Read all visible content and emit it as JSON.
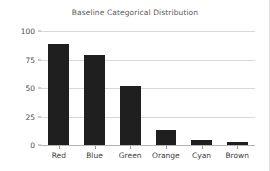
{
  "chart_data": {
    "type": "bar",
    "title": "Baseline Categorical Distribution",
    "xlabel": "",
    "ylabel": "",
    "categories": [
      "Red",
      "Blue",
      "Green",
      "Orange",
      "Cyan",
      "Brown"
    ],
    "values": [
      89,
      79,
      52,
      13,
      4,
      3
    ],
    "yticks": [
      0,
      25,
      50,
      75,
      100
    ],
    "ytick_labels": [
      "0",
      "25",
      "50",
      "75",
      "100"
    ],
    "ylim": [
      0,
      100
    ],
    "grid": true,
    "legend": null,
    "bar_color": "#1f1f1f",
    "grid_color": "#d8d8d8",
    "title_color": "#5a5a5a",
    "tick_color": "#3c3c3c"
  }
}
